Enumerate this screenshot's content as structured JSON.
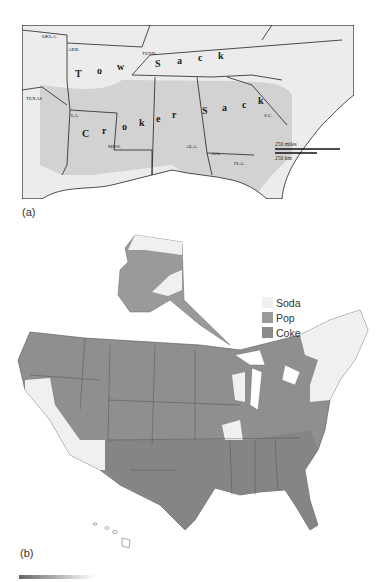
{
  "map_a": {
    "panel_label": "(a)",
    "state_labels": [
      "OKLA.",
      "ARK.",
      "TENN.",
      "TEXAS",
      "LA.",
      "MISS.",
      "ALA.",
      "GA.",
      "FLA.",
      "S.C."
    ],
    "region_labels": {
      "tow_sack": [
        "T",
        "o",
        "w",
        "S",
        "a",
        "c",
        "k"
      ],
      "croker_sack": [
        "C",
        "r",
        "o",
        "k",
        "e",
        "r",
        "S",
        "a",
        "c",
        "k"
      ]
    },
    "region_names": [
      "Tow Sack",
      "Croker Sack"
    ],
    "scale": {
      "miles": "250 miles",
      "km": "250 km"
    }
  },
  "map_b": {
    "panel_label": "(b)",
    "legend": [
      {
        "label": "Soda",
        "color": "#f0f0f0"
      },
      {
        "label": "Pop",
        "color": "#9a9a9a"
      },
      {
        "label": "Coke",
        "color": "#8a8a8a"
      }
    ]
  },
  "colors": {
    "land_light": "#ececec",
    "land_shaded": "#d2d2d2",
    "water": "#ffffff",
    "pop": "#9a9a9a",
    "coke": "#8c8c8c",
    "soda": "#f0f0f0"
  }
}
